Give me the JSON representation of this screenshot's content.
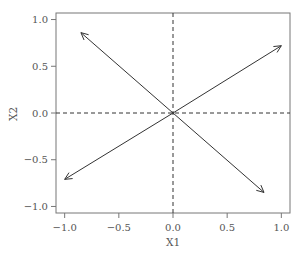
{
  "chart_data": {
    "type": "scatter",
    "subtype": "vector-plot",
    "title": "",
    "xlabel": "X1",
    "ylabel": "X2",
    "xlim": [
      -1.08,
      1.08
    ],
    "ylim": [
      -1.07,
      1.07
    ],
    "x_ticks": [
      -1.0,
      -0.5,
      0.0,
      0.5,
      1.0
    ],
    "x_tick_labels": [
      "−1.0",
      "−0.5",
      "0.0",
      "0.5",
      "1.0"
    ],
    "y_ticks": [
      -1.0,
      -0.5,
      0.0,
      0.5,
      1.0
    ],
    "y_tick_labels": [
      "−1.0",
      "−0.5",
      "0.0",
      "0.5",
      "1.0"
    ],
    "grid": false,
    "reference_lines": [
      {
        "orientation": "horizontal",
        "value": 0.0,
        "style": "dashed"
      },
      {
        "orientation": "vertical",
        "value": 0.0,
        "style": "dashed"
      }
    ],
    "arrows": [
      {
        "from": [
          0,
          0
        ],
        "to": [
          -0.85,
          0.86
        ]
      },
      {
        "from": [
          0,
          0
        ],
        "to": [
          1.0,
          0.72
        ]
      },
      {
        "from": [
          0,
          0
        ],
        "to": [
          -1.0,
          -0.71
        ]
      },
      {
        "from": [
          0,
          0
        ],
        "to": [
          0.84,
          -0.85
        ]
      }
    ],
    "legend": null,
    "colors": {
      "line": "#333333",
      "frame": "#777777",
      "text": "#555555"
    }
  }
}
